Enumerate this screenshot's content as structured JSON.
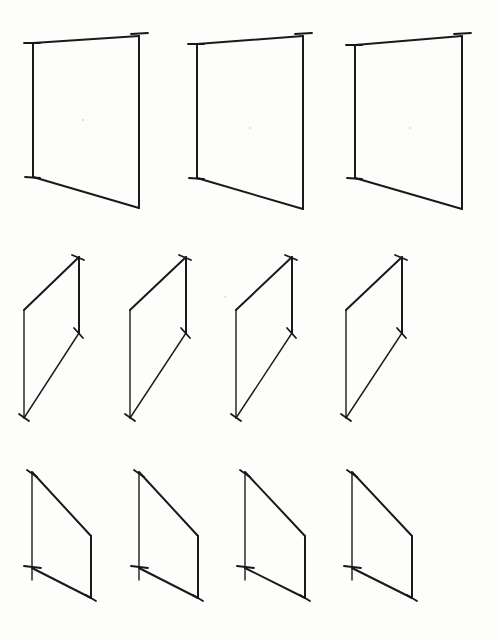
{
  "figure": {
    "background_color": "#fdfdfc",
    "ink_color": "#1a1a1a",
    "canvas": {
      "width": 498,
      "height": 640
    },
    "row_count": 3,
    "shape_count": 11
  },
  "rows": [
    {
      "id": "row-1",
      "label": "Top row — three large upright quadrilaterals",
      "shape_count": 3,
      "shape_kind": "quadrilateral-rising-top",
      "notes": "Vertical left and right edges; top edge slopes upward to the right; bottom edge slopes downward to the right. Short tick marks overshoot each corner.",
      "shapes": [
        {
          "id": "r1s1",
          "name": "quad-row1-1",
          "vertices": {
            "top_left": [
              33,
              43
            ],
            "top_right": [
              139,
              36
            ],
            "bottom_right": [
              139,
              208
            ],
            "bottom_left": [
              33,
              177
            ]
          },
          "ticks": [
            {
              "from": [
                24,
                43
              ],
              "to": [
                40,
                43
              ]
            },
            {
              "from": [
                131,
                34
              ],
              "to": [
                148,
                33
              ]
            },
            {
              "from": [
                25,
                177
              ],
              "to": [
                40,
                178
              ]
            }
          ]
        },
        {
          "id": "r1s2",
          "name": "quad-row1-2",
          "vertices": {
            "top_left": [
              197,
              44
            ],
            "top_right": [
              303,
              36
            ],
            "bottom_right": [
              303,
              209
            ],
            "bottom_left": [
              197,
              178
            ]
          },
          "ticks": [
            {
              "from": [
                188,
                44
              ],
              "to": [
                204,
                44
              ]
            },
            {
              "from": [
                295,
                34
              ],
              "to": [
                312,
                33
              ]
            },
            {
              "from": [
                189,
                178
              ],
              "to": [
                204,
                179
              ]
            }
          ]
        },
        {
          "id": "r1s3",
          "name": "quad-row1-3",
          "vertices": {
            "top_left": [
              355,
              45
            ],
            "top_right": [
              462,
              36
            ],
            "bottom_right": [
              462,
              209
            ],
            "bottom_left": [
              355,
              178
            ]
          },
          "ticks": [
            {
              "from": [
                346,
                45
              ],
              "to": [
                362,
                45
              ]
            },
            {
              "from": [
                454,
                34
              ],
              "to": [
                471,
                33
              ]
            },
            {
              "from": [
                347,
                178
              ],
              "to": [
                362,
                179
              ]
            }
          ]
        }
      ]
    },
    {
      "id": "row-2",
      "label": "Middle row — four narrow leaning parallelograms",
      "shape_count": 4,
      "shape_kind": "parallelogram-rising-top",
      "notes": "Long left vertical edge; top edge slopes steeply upward to the right; short right vertical edge descending from the top-right corner to a mid-height point; a long diagonal runs from that mid-height point down-left to the foot of the left vertical.",
      "shapes": [
        {
          "id": "r2s1",
          "name": "parallelogram-row2-1",
          "vertices": {
            "left_top": [
              24,
              310
            ],
            "right_top": [
              79,
              257
            ],
            "right_mid": [
              79,
              333
            ],
            "left_bottom": [
              24,
              418
            ]
          },
          "ticks": [
            {
              "from": [
                72,
                255
              ],
              "to": [
                84,
                260
              ]
            },
            {
              "from": [
                74,
                328
              ],
              "to": [
                83,
                338
              ]
            },
            {
              "from": [
                19,
                414
              ],
              "to": [
                29,
                421
              ]
            }
          ]
        },
        {
          "id": "r2s2",
          "name": "parallelogram-row2-2",
          "vertices": {
            "left_top": [
              130,
              310
            ],
            "right_top": [
              186,
              257
            ],
            "right_mid": [
              186,
              333
            ],
            "left_bottom": [
              130,
              418
            ]
          },
          "ticks": [
            {
              "from": [
                179,
                255
              ],
              "to": [
                191,
                260
              ]
            },
            {
              "from": [
                181,
                328
              ],
              "to": [
                190,
                338
              ]
            },
            {
              "from": [
                125,
                414
              ],
              "to": [
                135,
                421
              ]
            }
          ]
        },
        {
          "id": "r2s3",
          "name": "parallelogram-row2-3",
          "vertices": {
            "left_top": [
              236,
              310
            ],
            "right_top": [
              292,
              257
            ],
            "right_mid": [
              292,
              333
            ],
            "left_bottom": [
              236,
              418
            ]
          },
          "ticks": [
            {
              "from": [
                285,
                255
              ],
              "to": [
                297,
                260
              ]
            },
            {
              "from": [
                287,
                328
              ],
              "to": [
                296,
                338
              ]
            },
            {
              "from": [
                231,
                414
              ],
              "to": [
                241,
                421
              ]
            }
          ]
        },
        {
          "id": "r2s4",
          "name": "parallelogram-row2-4",
          "vertices": {
            "left_top": [
              346,
              310
            ],
            "right_top": [
              402,
              257
            ],
            "right_mid": [
              402,
              333
            ],
            "left_bottom": [
              346,
              418
            ]
          },
          "ticks": [
            {
              "from": [
                395,
                255
              ],
              "to": [
                407,
                260
              ]
            },
            {
              "from": [
                397,
                328
              ],
              "to": [
                406,
                338
              ]
            },
            {
              "from": [
                341,
                414
              ],
              "to": [
                351,
                421
              ]
            }
          ]
        }
      ]
    },
    {
      "id": "row-3",
      "label": "Bottom row — four quadrilaterals with falling top edge",
      "shape_count": 4,
      "shape_kind": "quadrilateral-falling-top",
      "notes": "Long left vertical edge carrying a cross tick about three-quarters of the way down; top edge slopes downward to the right to meet a shorter right vertical edge; bottom edge slopes downward to the right from the tick to the foot of the right vertical.",
      "shapes": [
        {
          "id": "r3s1",
          "name": "quad-row3-1",
          "vertices": {
            "left_top": [
              32,
              472
            ],
            "right_top": [
              91,
              536
            ],
            "right_bottom": [
              91,
              598
            ],
            "left_mid": [
              32,
              568
            ]
          },
          "ticks": [
            {
              "from": [
                27,
                470
              ],
              "to": [
                37,
                477
              ]
            },
            {
              "from": [
                24,
                566
              ],
              "to": [
                41,
                568
              ]
            },
            {
              "from": [
                86,
                595
              ],
              "to": [
                96,
                601
              ]
            }
          ]
        },
        {
          "id": "r3s2",
          "name": "quad-row3-2",
          "vertices": {
            "left_top": [
              139,
              472
            ],
            "right_top": [
              198,
              536
            ],
            "right_bottom": [
              198,
              598
            ],
            "left_mid": [
              139,
              568
            ]
          },
          "ticks": [
            {
              "from": [
                134,
                470
              ],
              "to": [
                144,
                477
              ]
            },
            {
              "from": [
                131,
                566
              ],
              "to": [
                148,
                568
              ]
            },
            {
              "from": [
                193,
                595
              ],
              "to": [
                203,
                601
              ]
            }
          ]
        },
        {
          "id": "r3s3",
          "name": "quad-row3-3",
          "vertices": {
            "left_top": [
              245,
              472
            ],
            "right_top": [
              305,
              536
            ],
            "right_bottom": [
              305,
              598
            ],
            "left_mid": [
              245,
              568
            ]
          },
          "ticks": [
            {
              "from": [
                240,
                470
              ],
              "to": [
                250,
                477
              ]
            },
            {
              "from": [
                237,
                566
              ],
              "to": [
                254,
                568
              ]
            },
            {
              "from": [
                300,
                595
              ],
              "to": [
                310,
                601
              ]
            }
          ]
        },
        {
          "id": "r3s4",
          "name": "quad-row3-4",
          "vertices": {
            "left_top": [
              352,
              472
            ],
            "right_top": [
              412,
              536
            ],
            "right_bottom": [
              412,
              598
            ],
            "left_mid": [
              352,
              568
            ]
          },
          "ticks": [
            {
              "from": [
                347,
                470
              ],
              "to": [
                357,
                477
              ]
            },
            {
              "from": [
                344,
                566
              ],
              "to": [
                361,
                568
              ]
            },
            {
              "from": [
                407,
                595
              ],
              "to": [
                417,
                601
              ]
            }
          ]
        }
      ]
    }
  ],
  "specks": [
    {
      "cx": 83,
      "cy": 120,
      "r": 1.1
    },
    {
      "cx": 250,
      "cy": 128,
      "r": 1.0
    },
    {
      "cx": 410,
      "cy": 128,
      "r": 1.0
    },
    {
      "cx": 225,
      "cy": 297,
      "r": 0.9
    }
  ],
  "stroke_widths": {
    "edge": 2.0,
    "thin_edge": 1.4,
    "tick": 1.8
  }
}
